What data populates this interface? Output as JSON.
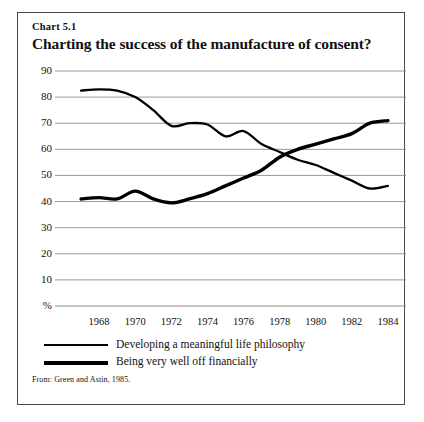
{
  "figure": {
    "number": "Chart 5.1",
    "title": "Charting the success of the manufacture of consent?",
    "source": "From: Green and Astin, 1985."
  },
  "chart_data": {
    "type": "line",
    "title": "Charting the success of the manufacture of consent?",
    "xlabel": "",
    "ylabel": "%",
    "xlim": [
      1966,
      1985
    ],
    "ylim": [
      0,
      90
    ],
    "ytick_labels": [
      "%",
      "10",
      "20",
      "30",
      "40",
      "50",
      "60",
      "70",
      "80",
      "90"
    ],
    "ytick_values": [
      0,
      10,
      20,
      30,
      40,
      50,
      60,
      70,
      80,
      90
    ],
    "xtick_labels": [
      "1968",
      "1970",
      "1972",
      "1974",
      "1976",
      "1978",
      "1980",
      "1982",
      "1984"
    ],
    "xtick_values": [
      1968,
      1970,
      1972,
      1974,
      1976,
      1978,
      1980,
      1982,
      1984
    ],
    "grid": "horizontal",
    "legend_position": "below-axis",
    "x": [
      1967,
      1968,
      1969,
      1970,
      1971,
      1972,
      1973,
      1974,
      1975,
      1976,
      1977,
      1978,
      1979,
      1980,
      1981,
      1982,
      1983,
      1984
    ],
    "series": [
      {
        "name": "Developing a meaningful life philosophy",
        "color": "#000000",
        "values": [
          82.5,
          83,
          82.5,
          80,
          75,
          69,
          70,
          69.5,
          65,
          67,
          62,
          59,
          56,
          54,
          51,
          48,
          45,
          46
        ]
      },
      {
        "name": "Being very well off financially",
        "color": "#000000",
        "values": [
          41,
          41.5,
          41,
          44,
          41,
          39.5,
          41,
          43,
          46,
          49,
          52,
          57,
          60,
          62,
          64,
          66,
          70,
          71
        ]
      }
    ]
  },
  "legend": {
    "items": [
      {
        "label": "Developing a meaningful life philosophy",
        "thickness": 2
      },
      {
        "label": "Being very well off financially",
        "thickness": 4
      }
    ]
  }
}
